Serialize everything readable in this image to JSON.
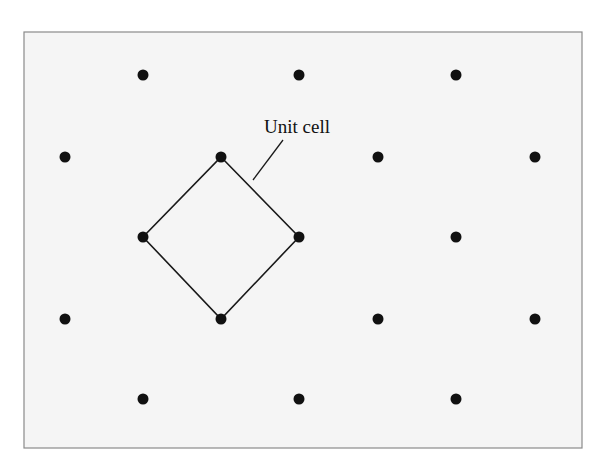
{
  "diagram": {
    "type": "2D lattice with unit cell",
    "colors": {
      "background": "#f5f5f5",
      "frame": "#8a8a8a",
      "point": "#111111",
      "line": "#1a1a1a"
    },
    "frame": {
      "x": 24,
      "y": 32,
      "width": 558,
      "height": 416
    },
    "point_radius": 5.5,
    "lattice_points": [
      {
        "x": 143,
        "y": 75
      },
      {
        "x": 299,
        "y": 75
      },
      {
        "x": 456,
        "y": 75
      },
      {
        "x": 65,
        "y": 157
      },
      {
        "x": 221,
        "y": 157
      },
      {
        "x": 378,
        "y": 157
      },
      {
        "x": 535,
        "y": 157
      },
      {
        "x": 143,
        "y": 237
      },
      {
        "x": 299,
        "y": 237
      },
      {
        "x": 456,
        "y": 237
      },
      {
        "x": 65,
        "y": 319
      },
      {
        "x": 221,
        "y": 319
      },
      {
        "x": 378,
        "y": 319
      },
      {
        "x": 535,
        "y": 319
      },
      {
        "x": 143,
        "y": 399
      },
      {
        "x": 299,
        "y": 399
      },
      {
        "x": 456,
        "y": 399
      }
    ],
    "unit_cell": {
      "vertices": [
        {
          "x": 221,
          "y": 157
        },
        {
          "x": 299,
          "y": 237
        },
        {
          "x": 221,
          "y": 319
        },
        {
          "x": 143,
          "y": 237
        }
      ],
      "label": "Unit cell",
      "label_position": {
        "x": 264,
        "y": 133
      },
      "leader_line": {
        "x1": 283,
        "y1": 140,
        "x2": 253,
        "y2": 180
      }
    }
  }
}
